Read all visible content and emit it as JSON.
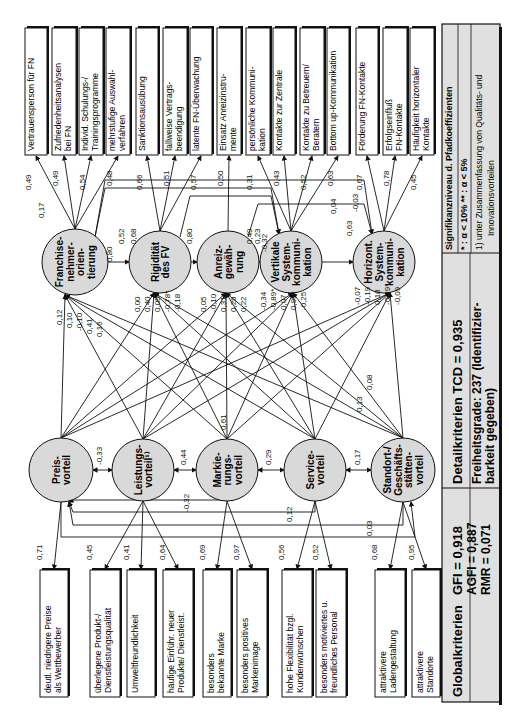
{
  "diagram": {
    "orientation": "rotated-90-ccw",
    "colors": {
      "node_fill": "#d9d9d9",
      "stroke": "#111111",
      "legend_fill": "#e0e0e0",
      "background": "#ffffff"
    },
    "top_indicators": [
      {
        "lines": [
          "Vertrauensperson für FN"
        ],
        "loading": "0,49"
      },
      {
        "lines": [
          "Zufriedenheitsanalysen",
          "bei FN"
        ],
        "loading": "0,49"
      },
      {
        "lines": [
          "Individ. Schulungs-/",
          "Trainingsprogramme"
        ],
        "loading": "0,54"
      },
      {
        "lines": [
          "mehrstufige Auswahl-",
          "verfahren"
        ],
        "loading": "0,48"
      },
      {
        "lines": [
          "Sanktionsausübung"
        ],
        "loading": "0,66"
      },
      {
        "lines": [
          "fallweise Vertrags-",
          "beendigung"
        ],
        "loading": "0,51"
      },
      {
        "lines": [
          "latente FN-Überwachung"
        ],
        "loading": "0,57"
      },
      {
        "lines": [
          "Einsatz Anreizinstru-",
          "mente"
        ],
        "loading": "0,50"
      },
      {
        "lines": [
          "persönliche Kommuni-",
          "kation"
        ],
        "loading": "0,31"
      },
      {
        "lines": [
          "Kontakte zur Zentrale"
        ],
        "loading": "0,43"
      },
      {
        "lines": [
          "Kontakte zu Betreuern/",
          "Beratern"
        ],
        "loading": "0,52"
      },
      {
        "lines": [
          "Bottom up-Kommunikation"
        ],
        "loading": "0,63"
      },
      {
        "lines": [
          "Förderung FN-Kontakte"
        ],
        "loading": "0,67"
      },
      {
        "lines": [
          "Erfolgseinfluß",
          "FN-Kontakte"
        ],
        "loading": "0,78"
      },
      {
        "lines": [
          "Häufigkeit horizontaler",
          "Kontakte"
        ],
        "loading": "0,45"
      }
    ],
    "upper_constructs": [
      {
        "lines": [
          "Franchise-",
          "nehmer-",
          "orien-",
          "tierung"
        ]
      },
      {
        "lines": [
          "Rigidität",
          "des FV"
        ]
      },
      {
        "lines": [
          "Anreiz-",
          "gewäh-",
          "rung"
        ]
      },
      {
        "lines": [
          "Vertikale",
          "System-",
          "kommuni-",
          "kation"
        ]
      },
      {
        "lines": [
          "Horizont.",
          "System-",
          "kommuni-",
          "kation"
        ]
      }
    ],
    "lower_constructs": [
      {
        "lines": [
          "Preis-",
          "vorteil"
        ]
      },
      {
        "lines": [
          "Leistungs-",
          "vorteil¹⁾"
        ]
      },
      {
        "lines": [
          "Markie-",
          "rungs-",
          "vorteil"
        ]
      },
      {
        "lines": [
          "Service-",
          "vorteil"
        ]
      },
      {
        "lines": [
          "Standort-/",
          "Geschäfts-",
          "stätten-",
          "vorteil"
        ]
      }
    ],
    "bottom_indicators": [
      {
        "lines": [
          "deutl. niedrigere Preise",
          "als Wettbewerber"
        ],
        "loading": "0,71"
      },
      {
        "lines": [
          "überlegene Produkt-/",
          "Dienstleistungsqualität"
        ],
        "loading": "0,45"
      },
      {
        "lines": [
          "Umweltfreundlichkeit"
        ],
        "loading": "0,41"
      },
      {
        "lines": [
          "häufige Einführ. neuer",
          "Produkte/ Dienstleist."
        ],
        "loading": "0,64"
      },
      {
        "lines": [
          "besonders",
          "bekannte Marke"
        ],
        "loading": "0,69"
      },
      {
        "lines": [
          "besonders positives",
          "Markenimage"
        ],
        "loading": "0,97"
      },
      {
        "lines": [
          "hohe Flexibilität bzgl.",
          "Kundenwünschen"
        ],
        "loading": "0,56"
      },
      {
        "lines": [
          "besonders motiviertes u.",
          "freundliches Personal"
        ],
        "loading": "0,52"
      },
      {
        "lines": [
          "attraktivere",
          "Ladengestaltung"
        ],
        "loading": "0,68"
      },
      {
        "lines": [
          "attraktivere",
          "Standorte"
        ],
        "loading": "0,95"
      }
    ],
    "upper_correlations": [
      {
        "label": "0,17"
      },
      {
        "label": "0,80"
      },
      {
        "label": "0,52"
      },
      {
        "label": "0,68"
      },
      {
        "label": "0,80"
      },
      {
        "label": "0,49"
      },
      {
        "label": "0,23"
      },
      {
        "label": "-0,32"
      },
      {
        "label": "0,04"
      },
      {
        "label": "-0,03"
      },
      {
        "label": "0,63"
      }
    ],
    "lower_correlations": [
      {
        "label": "-0,33"
      },
      {
        "label": "0,44"
      },
      {
        "label": "0,29"
      },
      {
        "label": "0,17"
      },
      {
        "label": "0,61"
      },
      {
        "label": "-0,32"
      },
      {
        "label": "0,12"
      },
      {
        "label": "0,03"
      },
      {
        "label": "0,08"
      },
      {
        "label": "0,13"
      }
    ],
    "path_coefficients": {
      "to_franchise": [
        "0,12",
        "0,10",
        "-0,10",
        "0,41",
        "0,16"
      ],
      "to_rigiditaet": [
        "0,00",
        "0,40",
        "0,05",
        "-0,78*",
        "-0,18"
      ],
      "to_anreiz": [
        "0,05",
        "-0,10",
        "0,31",
        "0,28",
        "0,22"
      ],
      "to_vertikal": [
        "-0,34",
        "-0,89*",
        "0,07",
        "0,99*",
        "-0,25"
      ],
      "to_horizont": [
        "-0,07",
        "-0,19",
        "0,18",
        "-0,69*",
        "-0,09"
      ]
    },
    "legend": {
      "global_label": "Globalkriterien",
      "gfi": "GFI  = 0,918",
      "agfi": "AGFI = 0,887",
      "rmr": "RMR = 0,071",
      "detail_label": "Detailkriterien TCD = 0,935",
      "freiheit_1": "Freiheitsgrade: 237 (Identifizier-",
      "freiheit_2": "barkeit gegeben)",
      "sig_title": "Signifikanzniveau d. Pfadkoeffizienten",
      "sig_values": "* : α < 10%    ** : α < 5%",
      "footnote_1": "1)  unter Zusammenfassung von Qualitäts- und",
      "footnote_2": "Innovationsvorteilen"
    }
  }
}
